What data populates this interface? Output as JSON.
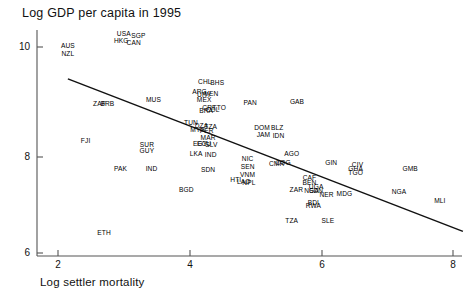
{
  "chart_data": {
    "type": "scatter",
    "title": "Log GDP per capita in 1995",
    "xlabel": "Log settler mortality",
    "ylabel": "",
    "xlim": [
      1.6,
      8.4
    ],
    "ylim": [
      5.75,
      10.6
    ],
    "xticks": [
      2,
      4,
      6,
      8
    ],
    "yticks": [
      6,
      8,
      10
    ],
    "grid": false,
    "legend": null,
    "label_style": "country-code-text-markers",
    "fit_line": {
      "type": "linear-regression",
      "x_start": 2.15,
      "y_start": 9.38,
      "x_end": 8.15,
      "y_end": 6.42
    },
    "points": [
      {
        "code": "AUS",
        "x": 2.15,
        "y": 10.02
      },
      {
        "code": "NZL",
        "x": 2.15,
        "y": 9.87
      },
      {
        "code": "USA",
        "x": 3.0,
        "y": 10.25
      },
      {
        "code": "SGP",
        "x": 3.22,
        "y": 10.21
      },
      {
        "code": "HKG",
        "x": 2.96,
        "y": 10.12
      },
      {
        "code": "CAN",
        "x": 3.15,
        "y": 10.08
      },
      {
        "code": "ZAF",
        "x": 2.63,
        "y": 8.9
      },
      {
        "code": "BRB",
        "x": 2.75,
        "y": 8.89
      },
      {
        "code": "MUS",
        "x": 3.45,
        "y": 8.98
      },
      {
        "code": "CHL",
        "x": 4.23,
        "y": 9.32
      },
      {
        "code": "BHS",
        "x": 4.42,
        "y": 9.31
      },
      {
        "code": "ARG",
        "x": 4.15,
        "y": 9.12
      },
      {
        "code": "VEN",
        "x": 4.33,
        "y": 9.08
      },
      {
        "code": "URY",
        "x": 4.22,
        "y": 9.06
      },
      {
        "code": "MEX",
        "x": 4.22,
        "y": 8.98
      },
      {
        "code": "CRI",
        "x": 4.28,
        "y": 8.82
      },
      {
        "code": "TTO",
        "x": 4.45,
        "y": 8.81
      },
      {
        "code": "BRA",
        "x": 4.25,
        "y": 8.76
      },
      {
        "code": "COL",
        "x": 4.35,
        "y": 8.78
      },
      {
        "code": "PAN",
        "x": 4.92,
        "y": 8.92
      },
      {
        "code": "GAB",
        "x": 5.63,
        "y": 8.94
      },
      {
        "code": "TUN",
        "x": 4.02,
        "y": 8.53
      },
      {
        "code": "DZA",
        "x": 4.18,
        "y": 8.46
      },
      {
        "code": "TZA",
        "x": 4.32,
        "y": 8.44
      },
      {
        "code": "MYS",
        "x": 4.12,
        "y": 8.38
      },
      {
        "code": "PER",
        "x": 4.26,
        "y": 8.37
      },
      {
        "code": "DOM",
        "x": 5.1,
        "y": 8.42
      },
      {
        "code": "BLZ",
        "x": 5.33,
        "y": 8.43
      },
      {
        "code": "JAM",
        "x": 5.12,
        "y": 8.3
      },
      {
        "code": "IDN",
        "x": 5.35,
        "y": 8.27
      },
      {
        "code": "MAR",
        "x": 4.28,
        "y": 8.23
      },
      {
        "code": "ECU",
        "x": 4.22,
        "y": 8.12
      },
      {
        "code": "SLV",
        "x": 4.33,
        "y": 8.1
      },
      {
        "code": "EGY",
        "x": 4.16,
        "y": 8.11
      },
      {
        "code": "SUR",
        "x": 3.35,
        "y": 8.1
      },
      {
        "code": "GUY",
        "x": 3.35,
        "y": 7.98
      },
      {
        "code": "FJI",
        "x": 2.42,
        "y": 8.18
      },
      {
        "code": "LKA",
        "x": 4.1,
        "y": 7.92
      },
      {
        "code": "IND",
        "x": 4.32,
        "y": 7.9
      },
      {
        "code": "AGO",
        "x": 5.55,
        "y": 7.92
      },
      {
        "code": "NIC",
        "x": 4.88,
        "y": 7.82
      },
      {
        "code": "SEN",
        "x": 4.88,
        "y": 7.68
      },
      {
        "code": "CMR",
        "x": 5.32,
        "y": 7.72
      },
      {
        "code": "COG",
        "x": 5.42,
        "y": 7.74
      },
      {
        "code": "GIN",
        "x": 6.15,
        "y": 7.74
      },
      {
        "code": "CIV",
        "x": 6.55,
        "y": 7.7
      },
      {
        "code": "GHA",
        "x": 6.52,
        "y": 7.64
      },
      {
        "code": "TGO",
        "x": 6.52,
        "y": 7.56
      },
      {
        "code": "GMB",
        "x": 7.35,
        "y": 7.63
      },
      {
        "code": "PAK",
        "x": 2.95,
        "y": 7.64
      },
      {
        "code": "IND2",
        "x": 3.42,
        "y": 7.63
      },
      {
        "code": "SDN",
        "x": 4.28,
        "y": 7.62
      },
      {
        "code": "VNM",
        "x": 4.88,
        "y": 7.52
      },
      {
        "code": "HTI",
        "x": 4.7,
        "y": 7.42
      },
      {
        "code": "LAO",
        "x": 4.82,
        "y": 7.38
      },
      {
        "code": "NPL",
        "x": 4.9,
        "y": 7.36
      },
      {
        "code": "CAF",
        "x": 5.82,
        "y": 7.46
      },
      {
        "code": "BEN",
        "x": 5.82,
        "y": 7.36
      },
      {
        "code": "UGA",
        "x": 5.92,
        "y": 7.28
      },
      {
        "code": "ZAR",
        "x": 5.62,
        "y": 7.22
      },
      {
        "code": "NGA2",
        "x": 5.85,
        "y": 7.2
      },
      {
        "code": "SDN2",
        "x": 5.92,
        "y": 7.2
      },
      {
        "code": "BGD",
        "x": 3.95,
        "y": 7.22
      },
      {
        "code": "NER",
        "x": 6.08,
        "y": 7.12
      },
      {
        "code": "MDG",
        "x": 6.35,
        "y": 7.14
      },
      {
        "code": "NGA",
        "x": 7.18,
        "y": 7.18
      },
      {
        "code": "MLI",
        "x": 7.8,
        "y": 7.02
      },
      {
        "code": "BDI",
        "x": 5.88,
        "y": 6.98
      },
      {
        "code": "RWA",
        "x": 5.88,
        "y": 6.92
      },
      {
        "code": "TZA2",
        "x": 5.55,
        "y": 6.62
      },
      {
        "code": "SLE",
        "x": 6.1,
        "y": 6.62
      },
      {
        "code": "ETH",
        "x": 2.7,
        "y": 6.38
      }
    ]
  }
}
